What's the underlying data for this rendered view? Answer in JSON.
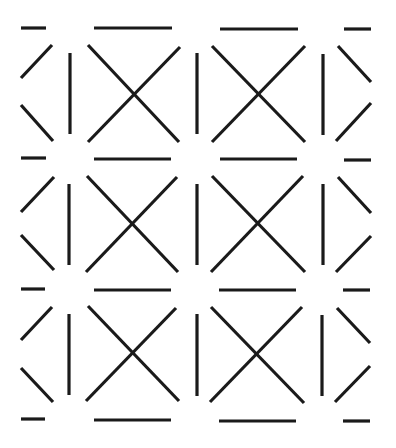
{
  "pattern": {
    "description": "Repeating geometric line pattern of X shapes, vertical bars, horizontal dashes and partial chevrons",
    "width": 396,
    "height": 448,
    "background": "#ffffff",
    "stroke_color": "#1a1a1a",
    "stroke_width": 3.2,
    "rows": 3,
    "segments": [
      {
        "name": "row1-left-dash-top",
        "x1": 21,
        "y1": 28,
        "x2": 46,
        "y2": 28
      },
      {
        "name": "row1-x1-top-line",
        "x1": 94,
        "y1": 28,
        "x2": 172,
        "y2": 28
      },
      {
        "name": "row1-x2-top-line",
        "x1": 220,
        "y1": 29,
        "x2": 298,
        "y2": 29
      },
      {
        "name": "row1-right-dash-top",
        "x1": 344,
        "y1": 29,
        "x2": 371,
        "y2": 29
      },
      {
        "name": "row1-left-chevron-upper",
        "x1": 21,
        "y1": 78,
        "x2": 52,
        "y2": 45
      },
      {
        "name": "row1-left-chevron-lower",
        "x1": 21,
        "y1": 105,
        "x2": 53,
        "y2": 141
      },
      {
        "name": "row1-vbar-1",
        "x1": 70,
        "y1": 53,
        "x2": 70,
        "y2": 134
      },
      {
        "name": "row1-x1-diag-a",
        "x1": 88,
        "y1": 45,
        "x2": 179,
        "y2": 142
      },
      {
        "name": "row1-x1-diag-b",
        "x1": 180,
        "y1": 47,
        "x2": 88,
        "y2": 142
      },
      {
        "name": "row1-vbar-2",
        "x1": 197,
        "y1": 53,
        "x2": 197,
        "y2": 134
      },
      {
        "name": "row1-x2-diag-a",
        "x1": 212,
        "y1": 46,
        "x2": 305,
        "y2": 142
      },
      {
        "name": "row1-x2-diag-b",
        "x1": 305,
        "y1": 46,
        "x2": 212,
        "y2": 142
      },
      {
        "name": "row1-vbar-3",
        "x1": 323,
        "y1": 54,
        "x2": 323,
        "y2": 135
      },
      {
        "name": "row1-right-chevron-upper",
        "x1": 338,
        "y1": 46,
        "x2": 371,
        "y2": 82
      },
      {
        "name": "row1-right-chevron-lower",
        "x1": 371,
        "y1": 103,
        "x2": 336,
        "y2": 141
      },
      {
        "name": "row2-left-dash-top",
        "x1": 21,
        "y1": 158,
        "x2": 46,
        "y2": 158
      },
      {
        "name": "row2-x1-top-line",
        "x1": 94,
        "y1": 159,
        "x2": 171,
        "y2": 159
      },
      {
        "name": "row2-x2-top-line",
        "x1": 220,
        "y1": 159,
        "x2": 297,
        "y2": 159
      },
      {
        "name": "row2-right-dash-top",
        "x1": 344,
        "y1": 160,
        "x2": 371,
        "y2": 160
      },
      {
        "name": "row2-left-chevron-upper",
        "x1": 21,
        "y1": 212,
        "x2": 54,
        "y2": 177
      },
      {
        "name": "row2-left-chevron-lower",
        "x1": 21,
        "y1": 235,
        "x2": 54,
        "y2": 270
      },
      {
        "name": "row2-vbar-1",
        "x1": 69,
        "y1": 184,
        "x2": 69,
        "y2": 265
      },
      {
        "name": "row2-x1-diag-a",
        "x1": 87,
        "y1": 176,
        "x2": 178,
        "y2": 272
      },
      {
        "name": "row2-x1-diag-b",
        "x1": 177,
        "y1": 177,
        "x2": 86,
        "y2": 272
      },
      {
        "name": "row2-vbar-2",
        "x1": 197,
        "y1": 184,
        "x2": 197,
        "y2": 265
      },
      {
        "name": "row2-x2-diag-a",
        "x1": 212,
        "y1": 176,
        "x2": 305,
        "y2": 272
      },
      {
        "name": "row2-x2-diag-b",
        "x1": 303,
        "y1": 176,
        "x2": 211,
        "y2": 272
      },
      {
        "name": "row2-vbar-3",
        "x1": 323,
        "y1": 184,
        "x2": 323,
        "y2": 265
      },
      {
        "name": "row2-right-chevron-upper",
        "x1": 338,
        "y1": 177,
        "x2": 371,
        "y2": 213
      },
      {
        "name": "row2-right-chevron-lower",
        "x1": 371,
        "y1": 236,
        "x2": 336,
        "y2": 272
      },
      {
        "name": "row3-left-dash-top",
        "x1": 21,
        "y1": 289,
        "x2": 45,
        "y2": 289
      },
      {
        "name": "row3-x1-top-line",
        "x1": 94,
        "y1": 290,
        "x2": 171,
        "y2": 290
      },
      {
        "name": "row3-x2-top-line",
        "x1": 219,
        "y1": 290,
        "x2": 296,
        "y2": 290
      },
      {
        "name": "row3-right-dash-top",
        "x1": 343,
        "y1": 290,
        "x2": 370,
        "y2": 290
      },
      {
        "name": "row3-left-chevron-upper",
        "x1": 21,
        "y1": 340,
        "x2": 52,
        "y2": 307
      },
      {
        "name": "row3-left-chevron-lower",
        "x1": 21,
        "y1": 368,
        "x2": 53,
        "y2": 402
      },
      {
        "name": "row3-vbar-1",
        "x1": 69,
        "y1": 314,
        "x2": 69,
        "y2": 395
      },
      {
        "name": "row3-x1-diag-a",
        "x1": 88,
        "y1": 306,
        "x2": 179,
        "y2": 401
      },
      {
        "name": "row3-x1-diag-b",
        "x1": 176,
        "y1": 308,
        "x2": 86,
        "y2": 401
      },
      {
        "name": "row3-vbar-2",
        "x1": 197,
        "y1": 314,
        "x2": 197,
        "y2": 396
      },
      {
        "name": "row3-x2-diag-a",
        "x1": 211,
        "y1": 307,
        "x2": 304,
        "y2": 403
      },
      {
        "name": "row3-x2-diag-b",
        "x1": 302,
        "y1": 307,
        "x2": 210,
        "y2": 402
      },
      {
        "name": "row3-vbar-3",
        "x1": 322,
        "y1": 315,
        "x2": 322,
        "y2": 396
      },
      {
        "name": "row3-right-chevron-upper",
        "x1": 337,
        "y1": 308,
        "x2": 370,
        "y2": 343
      },
      {
        "name": "row3-right-chevron-lower",
        "x1": 370,
        "y1": 366,
        "x2": 335,
        "y2": 402
      },
      {
        "name": "bottom-left-dash",
        "x1": 21,
        "y1": 419,
        "x2": 45,
        "y2": 419
      },
      {
        "name": "bottom-x1-line",
        "x1": 94,
        "y1": 420,
        "x2": 171,
        "y2": 420
      },
      {
        "name": "bottom-x2-line",
        "x1": 219,
        "y1": 421,
        "x2": 296,
        "y2": 421
      },
      {
        "name": "bottom-right-dash",
        "x1": 343,
        "y1": 421,
        "x2": 370,
        "y2": 421
      }
    ]
  }
}
